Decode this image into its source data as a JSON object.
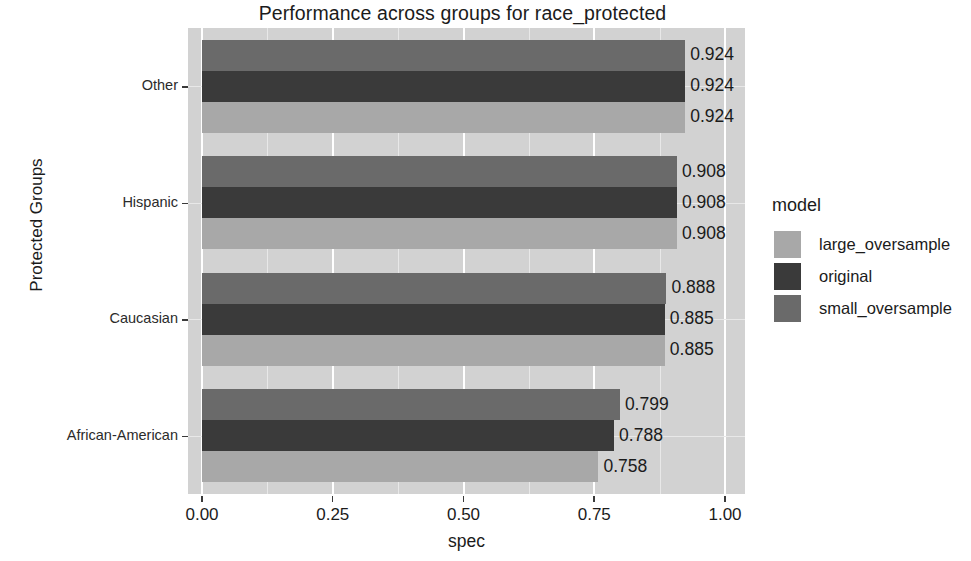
{
  "chart_data": {
    "type": "bar",
    "orientation": "horizontal",
    "title": "Performance across groups for race_protected",
    "xlabel": "spec",
    "ylabel": "Protected Groups",
    "categories": [
      "African-American",
      "Caucasian",
      "Hispanic",
      "Other"
    ],
    "category_order_top_to_bottom": [
      "Other",
      "Hispanic",
      "Caucasian",
      "African-American"
    ],
    "series": [
      {
        "name": "large_oversample",
        "color": "#a8a8a8",
        "values": [
          0.758,
          0.885,
          0.908,
          0.924
        ]
      },
      {
        "name": "original",
        "color": "#3a3a3a",
        "values": [
          0.788,
          0.885,
          0.908,
          0.924
        ]
      },
      {
        "name": "small_oversample",
        "color": "#6a6a6a",
        "values": [
          0.799,
          0.888,
          0.908,
          0.924
        ]
      }
    ],
    "xlim": [
      0.0,
      1.0
    ],
    "xticks": [
      0.0,
      0.25,
      0.5,
      0.75,
      1.0
    ],
    "xtick_labels": [
      "0.00",
      "0.25",
      "0.50",
      "0.75",
      "1.00"
    ],
    "grid": true,
    "legend_position": "right",
    "legend_title": "model",
    "panel_background": "#d2d2d2",
    "groups": [
      {
        "category": "Other",
        "bars": [
          {
            "model": "small_oversample",
            "value": 0.924,
            "label": "0.924",
            "color": "#6a6a6a"
          },
          {
            "model": "original",
            "value": 0.924,
            "label": "0.924",
            "color": "#3a3a3a"
          },
          {
            "model": "large_oversample",
            "value": 0.924,
            "label": "0.924",
            "color": "#a8a8a8"
          }
        ]
      },
      {
        "category": "Hispanic",
        "bars": [
          {
            "model": "small_oversample",
            "value": 0.908,
            "label": "0.908",
            "color": "#6a6a6a"
          },
          {
            "model": "original",
            "value": 0.908,
            "label": "0.908",
            "color": "#3a3a3a"
          },
          {
            "model": "large_oversample",
            "value": 0.908,
            "label": "0.908",
            "color": "#a8a8a8"
          }
        ]
      },
      {
        "category": "Caucasian",
        "bars": [
          {
            "model": "small_oversample",
            "value": 0.888,
            "label": "0.888",
            "color": "#6a6a6a"
          },
          {
            "model": "original",
            "value": 0.885,
            "label": "0.885",
            "color": "#3a3a3a"
          },
          {
            "model": "large_oversample",
            "value": 0.885,
            "label": "0.885",
            "color": "#a8a8a8"
          }
        ]
      },
      {
        "category": "African-American",
        "bars": [
          {
            "model": "small_oversample",
            "value": 0.799,
            "label": "0.799",
            "color": "#6a6a6a"
          },
          {
            "model": "original",
            "value": 0.788,
            "label": "0.788",
            "color": "#3a3a3a"
          },
          {
            "model": "large_oversample",
            "value": 0.758,
            "label": "0.758",
            "color": "#a8a8a8"
          }
        ]
      }
    ]
  },
  "legend": {
    "title": "model",
    "items": [
      {
        "label": "large_oversample",
        "color": "#a8a8a8"
      },
      {
        "label": "original",
        "color": "#3a3a3a"
      },
      {
        "label": "small_oversample",
        "color": "#6a6a6a"
      }
    ]
  },
  "axes": {
    "y_title": "Protected Groups",
    "x_title": "spec",
    "y_tick_labels": [
      "Other",
      "Hispanic",
      "Caucasian",
      "African-American"
    ],
    "x_tick_labels": [
      "0.00",
      "0.25",
      "0.50",
      "0.75",
      "1.00"
    ]
  },
  "title": "Performance across groups for race_protected"
}
